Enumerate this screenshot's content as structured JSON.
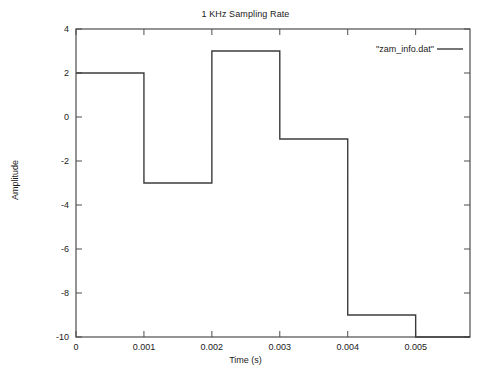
{
  "chart_data": {
    "type": "line",
    "title": "1 KHz Sampling Rate",
    "xlabel": "Time (s)",
    "ylabel": "Amplitude",
    "xlim": [
      0,
      0.0058
    ],
    "ylim": [
      -10,
      4
    ],
    "grid": false,
    "legend_position": "top-right",
    "legend": [
      "\"zam_info.dat\""
    ],
    "drawstyle": "steps-post",
    "xticks": [
      0,
      0.001,
      0.002,
      0.003,
      0.004,
      0.005
    ],
    "xtick_labels": [
      "0",
      "0.001",
      "0.002",
      "0.003",
      "0.004",
      "0.005"
    ],
    "yticks": [
      4,
      2,
      0,
      -2,
      -4,
      -6,
      -8,
      -10
    ],
    "ytick_labels": [
      "4",
      "2",
      "0",
      "-2",
      "-4",
      "-6",
      "-8",
      "-10"
    ],
    "series": [
      {
        "name": "\"zam_info.dat\"",
        "color": "#3c3c3c",
        "x": [
          0,
          0.001,
          0.002,
          0.003,
          0.004,
          0.005,
          0.0058
        ],
        "values": [
          2,
          -3,
          3,
          -1,
          -9,
          -10,
          -10
        ]
      }
    ]
  },
  "axes": {
    "title": "1 KHz Sampling Rate",
    "xlabel": "Time (s)",
    "ylabel": "Amplitude"
  },
  "legend": {
    "entry_label": "\"zam_info.dat\""
  },
  "colors": {
    "series": "#3c3c3c",
    "frame": "#4d4d4d",
    "text": "#1a1a1a",
    "background": "#ffffff"
  }
}
